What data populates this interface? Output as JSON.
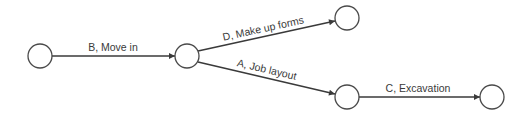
{
  "diagram": {
    "type": "activity-on-arrow network",
    "nodes": [
      {
        "id": "n1",
        "cx": 40,
        "cy": 56
      },
      {
        "id": "n2",
        "cx": 187,
        "cy": 56
      },
      {
        "id": "n3",
        "cx": 347,
        "cy": 18
      },
      {
        "id": "n4",
        "cx": 347,
        "cy": 97
      },
      {
        "id": "n5",
        "cx": 492,
        "cy": 97
      }
    ],
    "edges": [
      {
        "from": "n1",
        "to": "n2",
        "label": "B, Move in"
      },
      {
        "from": "n2",
        "to": "n3",
        "label": "D, Make up forms"
      },
      {
        "from": "n2",
        "to": "n4",
        "label": "A, Job layout"
      },
      {
        "from": "n4",
        "to": "n5",
        "label": "C, Excavation"
      }
    ],
    "colors": {
      "line": "#3a3a3a",
      "node_stroke": "#4a4a4a",
      "background": "#ffffff"
    }
  }
}
